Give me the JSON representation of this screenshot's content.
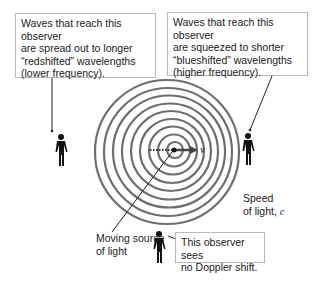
{
  "callouts": {
    "left": {
      "line1": "Waves that reach this observer",
      "line2": "are spread out to longer",
      "line3": "“redshifted” wavelengths",
      "line4": "(lower frequency)."
    },
    "right": {
      "line1": "Waves that reach this observer",
      "line2": "are squeezed to shorter",
      "line3": "“blueshifted” wavelengths",
      "line4": "(higher frequency)."
    },
    "bottom": {
      "line1": "This observer sees",
      "line2": "no Doppler shift."
    }
  },
  "labels": {
    "source_line1": "Moving source",
    "source_line2": "of light",
    "speed_line1": "Speed",
    "speed_line2": "of light, ",
    "speed_symbol": "c",
    "velocity_symbol": "v"
  },
  "colors": {
    "ring": "#6e6e6e",
    "figure": "#111111",
    "arrow": "#444444",
    "callout_border": "#b8b8b8"
  }
}
